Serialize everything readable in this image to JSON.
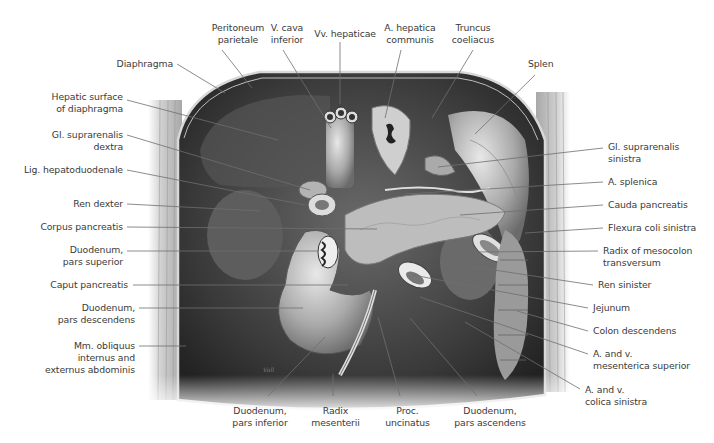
{
  "figure": {
    "colors": {
      "background": "#ffffff",
      "label_text": "#3a3a3a",
      "leader_line": "#6e6e6e",
      "cavity_dark": "#2f2f2f",
      "organ_mid": "#8a8a8a",
      "organ_light": "#d6d6d6",
      "wall": "#c9c9c9"
    },
    "signature": "Voll"
  },
  "labels": [
    {
      "id": "peritoneum-parietale",
      "lines": [
        "Peritoneum",
        "parietale"
      ],
      "align": "c",
      "x": 208,
      "y": 22,
      "w": 60,
      "lx1": 222,
      "ly1": 50,
      "lx2": 252,
      "ly2": 88
    },
    {
      "id": "v-cava-inferior",
      "lines": [
        "V. cava",
        "inferior"
      ],
      "align": "c",
      "x": 262,
      "y": 22,
      "w": 50,
      "lx1": 283,
      "ly1": 50,
      "lx2": 331,
      "ly2": 128
    },
    {
      "id": "vv-hepaticae",
      "lines": [
        "Vv. hepaticae"
      ],
      "align": "c",
      "x": 305,
      "y": 28,
      "w": 80,
      "lx1": 340,
      "ly1": 42,
      "lx2": 340,
      "ly2": 104
    },
    {
      "id": "a-hepatica-communis",
      "lines": [
        "A. hepatica",
        "communis"
      ],
      "align": "c",
      "x": 380,
      "y": 22,
      "w": 60,
      "lx1": 401,
      "ly1": 50,
      "lx2": 385,
      "ly2": 118
    },
    {
      "id": "truncus-coeliacus",
      "lines": [
        "Truncus",
        "coeliacus"
      ],
      "align": "c",
      "x": 448,
      "y": 22,
      "w": 50,
      "lx1": 473,
      "ly1": 50,
      "lx2": 432,
      "ly2": 118
    },
    {
      "id": "splen",
      "lines": [
        "Splen"
      ],
      "align": "l",
      "x": 528,
      "y": 58,
      "w": 40,
      "lx1": 535,
      "ly1": 75,
      "lx2": 475,
      "ly2": 134
    },
    {
      "id": "diaphragma",
      "lines": [
        "Diaphragma"
      ],
      "align": "r",
      "x": 108,
      "y": 58,
      "w": 65,
      "lx1": 177,
      "ly1": 64,
      "lx2": 225,
      "ly2": 93
    },
    {
      "id": "hepatic-surface-of-diaphragma",
      "lines": [
        "Hepatic surface",
        "of diaphragma"
      ],
      "align": "r",
      "x": 40,
      "y": 91,
      "w": 83,
      "lx1": 127,
      "ly1": 100,
      "lx2": 278,
      "ly2": 140
    },
    {
      "id": "gl-suprarenalis-dextra",
      "lines": [
        "Gl. suprarenalis",
        "dextra"
      ],
      "align": "r",
      "x": 40,
      "y": 129,
      "w": 83,
      "lx1": 127,
      "ly1": 135,
      "lx2": 310,
      "ly2": 190
    },
    {
      "id": "lig-hepatoduodenale",
      "lines": [
        "Lig. hepatoduodenale"
      ],
      "align": "r",
      "x": 10,
      "y": 164,
      "w": 113,
      "lx1": 127,
      "ly1": 170,
      "lx2": 305,
      "ly2": 205
    },
    {
      "id": "ren-dexter",
      "lines": [
        "Ren dexter"
      ],
      "align": "r",
      "x": 60,
      "y": 198,
      "w": 63,
      "lx1": 127,
      "ly1": 204,
      "lx2": 260,
      "ly2": 211
    },
    {
      "id": "corpus-pancreatis",
      "lines": [
        "Corpus pancreatis"
      ],
      "align": "r",
      "x": 30,
      "y": 221,
      "w": 93,
      "lx1": 127,
      "ly1": 227,
      "lx2": 377,
      "ly2": 229
    },
    {
      "id": "duodenum-pars-superior",
      "lines": [
        "Duodenum,",
        "pars superior"
      ],
      "align": "r",
      "x": 50,
      "y": 244,
      "w": 73,
      "lx1": 127,
      "ly1": 251,
      "lx2": 318,
      "ly2": 251
    },
    {
      "id": "caput-pancreatis",
      "lines": [
        "Caput pancreatis"
      ],
      "align": "r",
      "x": 30,
      "y": 279,
      "w": 98,
      "lx1": 133,
      "ly1": 285,
      "lx2": 348,
      "ly2": 285
    },
    {
      "id": "duodenum-pars-descendens",
      "lines": [
        "Duodenum,",
        "pars descendens"
      ],
      "align": "r",
      "x": 40,
      "y": 302,
      "w": 95,
      "lx1": 139,
      "ly1": 308,
      "lx2": 303,
      "ly2": 308
    },
    {
      "id": "mm-obliquus-internus-externus",
      "lines": [
        "Mm. obliquus",
        "internus and",
        "externus abdominis"
      ],
      "align": "r",
      "x": 30,
      "y": 340,
      "w": 105,
      "lx1": 139,
      "ly1": 346,
      "lx2": 186,
      "ly2": 346
    },
    {
      "id": "gl-suprarenalis-sinistra",
      "lines": [
        "Gl. suprarenalis",
        "sinistra"
      ],
      "align": "l",
      "x": 608,
      "y": 141,
      "w": 95,
      "lx1": 603,
      "ly1": 148,
      "lx2": 438,
      "ly2": 167
    },
    {
      "id": "a-splenica",
      "lines": [
        "A. splenica"
      ],
      "align": "l",
      "x": 608,
      "y": 176,
      "w": 80,
      "lx1": 603,
      "ly1": 182,
      "lx2": 405,
      "ly2": 194
    },
    {
      "id": "cauda-pancreatis",
      "lines": [
        "Cauda pancreatis"
      ],
      "align": "l",
      "x": 608,
      "y": 199,
      "w": 95,
      "lx1": 603,
      "ly1": 205,
      "lx2": 460,
      "ly2": 215
    },
    {
      "id": "flexura-coli-sinistra",
      "lines": [
        "Flexura coli sinistra"
      ],
      "align": "l",
      "x": 608,
      "y": 222,
      "w": 105,
      "lx1": 603,
      "ly1": 228,
      "lx2": 525,
      "ly2": 233
    },
    {
      "id": "radix-of-mesocolon-transversum",
      "lines": [
        "Radix of mesocolon",
        "transversum"
      ],
      "align": "l",
      "x": 603,
      "y": 245,
      "w": 110,
      "lx1": 598,
      "ly1": 251,
      "lx2": 475,
      "ly2": 252
    },
    {
      "id": "ren-sinister",
      "lines": [
        "Ren sinister"
      ],
      "align": "l",
      "x": 598,
      "y": 279,
      "w": 80,
      "lx1": 593,
      "ly1": 285,
      "lx2": 461,
      "ly2": 265
    },
    {
      "id": "jejunum",
      "lines": [
        "Jejunum"
      ],
      "align": "l",
      "x": 593,
      "y": 302,
      "w": 60,
      "lx1": 588,
      "ly1": 308,
      "lx2": 413,
      "ly2": 275
    },
    {
      "id": "colon-descendens",
      "lines": [
        "Colon descendens"
      ],
      "align": "l",
      "x": 593,
      "y": 325,
      "w": 100,
      "lx1": 588,
      "ly1": 331,
      "lx2": 517,
      "ly2": 311
    },
    {
      "id": "a-v-mesenterica-superior",
      "lines": [
        "A. and v.",
        "mesenterica superior"
      ],
      "align": "l",
      "x": 593,
      "y": 348,
      "w": 115,
      "lx1": 588,
      "ly1": 354,
      "lx2": 420,
      "ly2": 297
    },
    {
      "id": "a-v-colica-sinistra",
      "lines": [
        "A. and v.",
        "colica sinistra"
      ],
      "align": "l",
      "x": 585,
      "y": 384,
      "w": 95,
      "lx1": 580,
      "ly1": 389,
      "lx2": 465,
      "ly2": 322
    },
    {
      "id": "duodenum-pars-inferior",
      "lines": [
        "Duodenum,",
        "pars inferior"
      ],
      "align": "c",
      "x": 225,
      "y": 405,
      "w": 70,
      "lx1": 268,
      "ly1": 396,
      "lx2": 325,
      "ly2": 337
    },
    {
      "id": "radix-mesenterii",
      "lines": [
        "Radix",
        "mesenterii"
      ],
      "align": "c",
      "x": 308,
      "y": 405,
      "w": 55,
      "lx1": 333,
      "ly1": 396,
      "lx2": 333,
      "ly2": 374
    },
    {
      "id": "proc-uncinatus",
      "lines": [
        "Proc.",
        "uncinatus"
      ],
      "align": "c",
      "x": 380,
      "y": 405,
      "w": 55,
      "lx1": 400,
      "ly1": 396,
      "lx2": 378,
      "ly2": 317
    },
    {
      "id": "duodenum-pars-ascendens",
      "lines": [
        "Duodenum,",
        "pars ascendens"
      ],
      "align": "c",
      "x": 445,
      "y": 405,
      "w": 90,
      "lx1": 477,
      "ly1": 396,
      "lx2": 410,
      "ly2": 318
    }
  ]
}
